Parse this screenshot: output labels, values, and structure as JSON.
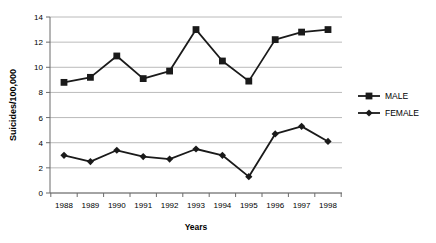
{
  "chart_data": {
    "type": "line",
    "title": "",
    "xlabel": "Years",
    "ylabel": "Suicides/100,000",
    "categories": [
      "1988",
      "1989",
      "1990",
      "1991",
      "1992",
      "1993",
      "1994",
      "1995",
      "1996",
      "1997",
      "1998"
    ],
    "series": [
      {
        "name": "MALE",
        "marker": "square",
        "values": [
          8.8,
          9.2,
          10.9,
          9.1,
          9.7,
          13.0,
          10.5,
          8.9,
          12.2,
          12.8,
          13.0
        ]
      },
      {
        "name": "FEMALE",
        "marker": "diamond",
        "values": [
          3.0,
          2.5,
          3.4,
          2.9,
          2.7,
          3.5,
          3.0,
          1.3,
          4.7,
          5.3,
          4.1
        ]
      }
    ],
    "ylim": [
      0,
      14
    ],
    "yticks": [
      "0",
      "2",
      "4",
      "6",
      "8",
      "10",
      "12",
      "14"
    ],
    "ytick_values": [
      0,
      2,
      4,
      6,
      8,
      10,
      12,
      14
    ],
    "grid": true,
    "grid_axis": "y",
    "legend_position": "right",
    "line_color": "#1a1a1a",
    "grid_color": "#a8a8a8",
    "axis_color": "#6b6b6b"
  },
  "legend": {
    "entries": [
      {
        "label": "MALE"
      },
      {
        "label": "FEMALE"
      }
    ]
  }
}
